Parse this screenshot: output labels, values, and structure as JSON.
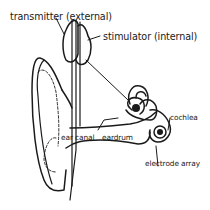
{
  "diagram": {
    "colors": {
      "stroke": "#1a1a1a",
      "background": "#ffffff"
    },
    "labels": {
      "transmitter": "transmitter (external)",
      "stimulator": "stimulator (internal)",
      "ear_canal": "ear canal",
      "eardrum": "eardrum",
      "cochlea": "cochlea",
      "electrode_array": "electrode array"
    }
  }
}
